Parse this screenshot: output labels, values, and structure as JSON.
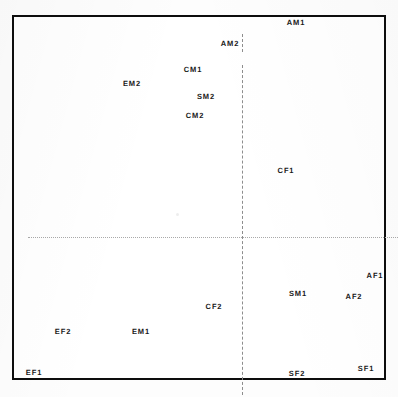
{
  "figure": {
    "kind": "ordination-scatter",
    "background_color": "#ffffff",
    "frame_color": "#0d0d0d",
    "label_color": "#1a1a1a",
    "vertical_axis_color": "#8d8d8d",
    "horizontal_axis_color": "#a9a9a9"
  },
  "chart_data": {
    "type": "scatter",
    "title": "",
    "subtitle": "",
    "xlabel": "",
    "ylabel": "",
    "xlim": [
      -1,
      1
    ],
    "ylim": [
      -1,
      1
    ],
    "grid": false,
    "legend": null,
    "axes": {
      "vertical_zero_line": {
        "style": "dashed",
        "x": 0.0
      },
      "horizontal_zero_line": {
        "style": "dotted",
        "y": 0.0
      }
    },
    "labels_only": true,
    "points": [
      {
        "label": "AM1",
        "x": 0.5,
        "y": 0.97,
        "px": 294,
        "py": 21
      },
      {
        "label": "AM2",
        "x": 0.0,
        "y": 0.86,
        "px": 228,
        "py": 41
      },
      {
        "label": "CM1",
        "x": -0.21,
        "y": 0.74,
        "px": 191,
        "py": 68
      },
      {
        "label": "EM2",
        "x": -0.59,
        "y": 0.68,
        "px": 130,
        "py": 82
      },
      {
        "label": "SM2",
        "x": -0.1,
        "y": 0.61,
        "px": 204,
        "py": 95
      },
      {
        "label": "CM2",
        "x": -0.2,
        "y": 0.52,
        "px": 193,
        "py": 114
      },
      {
        "label": "CF1",
        "x": 0.33,
        "y": 0.28,
        "px": 284,
        "py": 169
      },
      {
        "label": "AF1",
        "x": 0.87,
        "y": -0.29,
        "px": 373,
        "py": 274
      },
      {
        "label": "SM1",
        "x": 0.43,
        "y": -0.38,
        "px": 296,
        "py": 292
      },
      {
        "label": "AF2",
        "x": 0.7,
        "y": -0.38,
        "px": 352,
        "py": 295
      },
      {
        "label": "CF2",
        "x": -0.08,
        "y": -0.44,
        "px": 212,
        "py": 305
      },
      {
        "label": "EM1",
        "x": -0.71,
        "y": -0.57,
        "px": 139,
        "py": 330
      },
      {
        "label": "EF2",
        "x": -0.87,
        "y": -0.57,
        "px": 61,
        "py": 330
      },
      {
        "label": "EF1",
        "x": -0.98,
        "y": -0.74,
        "px": 32,
        "py": 371
      },
      {
        "label": "SF2",
        "x": 0.37,
        "y": -0.75,
        "px": 295,
        "py": 372
      },
      {
        "label": "SF1",
        "x": 0.78,
        "y": -0.73,
        "px": 364,
        "py": 367
      }
    ]
  }
}
